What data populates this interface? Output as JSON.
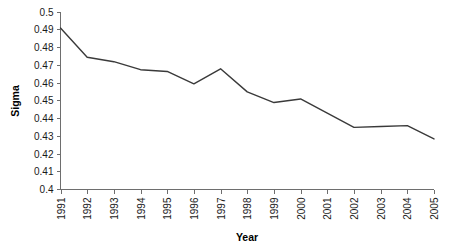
{
  "chart_data": {
    "type": "line",
    "title": "",
    "xlabel": "Year",
    "ylabel": "Sigma",
    "categories": [
      "1991",
      "1992",
      "1993",
      "1994",
      "1995",
      "1996",
      "1997",
      "1998",
      "1999",
      "2000",
      "2001",
      "2002",
      "2003",
      "2004",
      "2005"
    ],
    "x": [
      1991,
      1992,
      1993,
      1994,
      1995,
      1996,
      1997,
      1998,
      1999,
      2000,
      2001,
      2002,
      2003,
      2004,
      2005
    ],
    "values": [
      0.491,
      0.4745,
      0.472,
      0.4675,
      0.4665,
      0.4595,
      0.468,
      0.455,
      0.449,
      0.451,
      0.443,
      0.435,
      0.4355,
      0.436,
      0.4285
    ],
    "series": [
      {
        "name": "Sigma",
        "values": [
          0.491,
          0.4745,
          0.472,
          0.4675,
          0.4665,
          0.4595,
          0.468,
          0.455,
          0.449,
          0.451,
          0.443,
          0.435,
          0.4355,
          0.436,
          0.4285
        ]
      }
    ],
    "ylim": [
      0.4,
      0.5
    ],
    "ytick_labels": [
      "0.5",
      "0.49",
      "0.48",
      "0.47",
      "0.46",
      "0.45",
      "0.44",
      "0.43",
      "0.42",
      "0.41",
      "0.4"
    ],
    "ytick_values": [
      0.5,
      0.49,
      0.48,
      0.47,
      0.46,
      0.45,
      0.44,
      0.43,
      0.42,
      0.41,
      0.4
    ],
    "xlim": [
      1991,
      2005
    ],
    "grid": false,
    "legend": false,
    "legend_position": "none",
    "line_color": "#3a3a3a",
    "axis_color": "#6e6e6e",
    "background_color": "#ffffff"
  }
}
